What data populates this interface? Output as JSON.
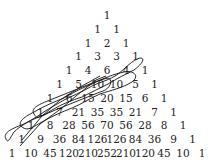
{
  "rows": [
    [
      "1"
    ],
    [
      "1",
      "1"
    ],
    [
      "1",
      "2",
      "1"
    ],
    [
      "1",
      "3",
      "3",
      "1"
    ],
    [
      "1",
      "4",
      "6",
      "4",
      "1"
    ],
    [
      "1",
      "5",
      "10",
      "10",
      "5",
      "1"
    ],
    [
      "1",
      "6",
      "15",
      "20",
      "15",
      "6",
      "1"
    ],
    [
      "1",
      "7",
      "21",
      "35",
      "35",
      "21",
      "7",
      "1"
    ],
    [
      "1",
      "8",
      "28",
      "56",
      "70",
      "56",
      "28",
      "8",
      "1"
    ],
    [
      "1",
      "9",
      "36",
      "84",
      "126",
      "126",
      "84",
      "36",
      "9",
      "1"
    ],
    [
      "1",
      "10",
      "45",
      "120",
      "210",
      "252",
      "210",
      "120",
      "45",
      "10",
      "1"
    ]
  ],
  "loop_color": "#111111",
  "text_color": "#222222"
}
